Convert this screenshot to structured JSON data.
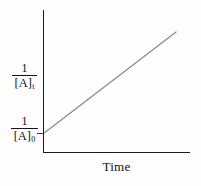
{
  "figure": {
    "background_color": "#fefefe",
    "axis_color": "#1a1a1a",
    "line_color": "#8a8a8a"
  },
  "labels": {
    "y_upper": {
      "numerator": "1",
      "denominator_base": "[A]",
      "denominator_sub": "t"
    },
    "y_lower": {
      "numerator": "1",
      "denominator_base": "[A]",
      "denominator_sub": "0"
    },
    "x_axis": "Time"
  },
  "chart_data": {
    "type": "line",
    "title": "",
    "xlabel": "Time",
    "ylabel": "1/[A]t",
    "grid": false,
    "legend": null,
    "annotations": [
      {
        "name": "y-intercept-tick",
        "text": "1/[A]0",
        "y_fraction": 0.134
      }
    ],
    "axis_ranges": {
      "x": [
        0,
        1
      ],
      "y": [
        0,
        1
      ]
    },
    "series": [
      {
        "name": "inverse-concentration",
        "description": "Straight rising line: second-order kinetics plot of 1/[A] versus time",
        "x": [
          0.0,
          1.0
        ],
        "y": [
          0.134,
          0.845
        ]
      }
    ]
  }
}
